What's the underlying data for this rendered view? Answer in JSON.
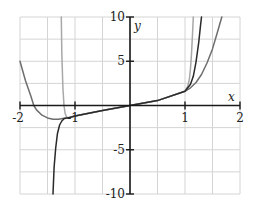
{
  "chart_data": {
    "type": "line",
    "title": "",
    "xlabel": "x",
    "ylabel": "y",
    "xlim": [
      -2,
      2
    ],
    "ylim": [
      -10,
      10
    ],
    "grid": true,
    "grid_step": {
      "x": 0.5,
      "y": 2.5
    },
    "x_ticks": [
      -2,
      -1,
      1,
      2
    ],
    "x_tick_labels": [
      "-2",
      "-1",
      "1",
      "2"
    ],
    "y_ticks": [
      10,
      5,
      -5,
      -10
    ],
    "y_tick_labels": [
      "10",
      "5",
      "-5",
      "-10"
    ],
    "legend": null,
    "series": [
      {
        "name": "curve-medium-gray",
        "color": "#6e6e6e",
        "x": [
          -2.0,
          -1.9,
          -1.8,
          -1.75,
          -1.7,
          -1.6,
          -1.5,
          -1.4,
          -1.3,
          -1.2,
          -1.1,
          -1.0,
          -0.5,
          0.0,
          0.5,
          1.0,
          1.1,
          1.2,
          1.3,
          1.4,
          1.5,
          1.6,
          1.67
        ],
        "y": [
          5.0,
          2.8,
          1.0,
          0.0,
          -0.5,
          -1.1,
          -1.4,
          -1.55,
          -1.55,
          -1.45,
          -1.35,
          -1.2,
          -0.55,
          0.0,
          0.55,
          1.6,
          2.0,
          2.6,
          3.5,
          4.8,
          6.4,
          8.5,
          10.0
        ]
      },
      {
        "name": "curve-light-gray",
        "color": "#a8a8a8",
        "x": [
          -1.25,
          -1.24,
          -1.22,
          -1.2,
          -1.18,
          -1.15,
          -1.1,
          -1.0,
          -0.5,
          0.0,
          0.5,
          1.0,
          1.05,
          1.08,
          1.1,
          1.12,
          1.14,
          1.15
        ],
        "y": [
          10.0,
          6.0,
          2.0,
          0.0,
          -0.9,
          -1.35,
          -1.35,
          -1.2,
          -0.55,
          0.0,
          0.55,
          1.6,
          2.2,
          3.0,
          4.2,
          6.0,
          8.5,
          10.0
        ]
      },
      {
        "name": "curve-dark",
        "color": "#2a2a2a",
        "x": [
          -1.4,
          -1.38,
          -1.35,
          -1.32,
          -1.28,
          -1.24,
          -1.2,
          -1.15,
          -1.1,
          -1.0,
          -0.5,
          0.0,
          0.5,
          1.0,
          1.1,
          1.15,
          1.2,
          1.25,
          1.28,
          1.3
        ],
        "y": [
          -10.0,
          -7.0,
          -4.8,
          -3.2,
          -2.2,
          -1.75,
          -1.5,
          -1.4,
          -1.35,
          -1.2,
          -0.55,
          0.0,
          0.55,
          1.6,
          2.4,
          3.3,
          4.9,
          7.2,
          8.9,
          10.0
        ]
      }
    ]
  }
}
